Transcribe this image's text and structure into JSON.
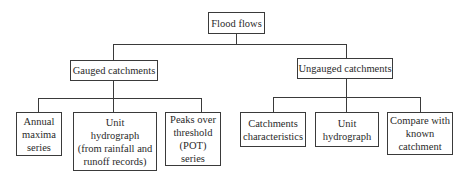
{
  "diagram": {
    "type": "tree",
    "root": {
      "label": "Flood flows"
    },
    "branches": [
      {
        "label": "Gauged catchments",
        "children": [
          {
            "label": "Annual\nmaxima\nseries"
          },
          {
            "label": "Unit\nhydrograph\n(from rainfall and\nrunoff records)"
          },
          {
            "label": "Peaks over\nthreshold\n(POT)\nseries"
          }
        ]
      },
      {
        "label": "Ungauged catchments",
        "children": [
          {
            "label": "Catchments\ncharacteristics"
          },
          {
            "label": "Unit\nhydrograph"
          },
          {
            "label": "Compare with\nknown\ncatchment"
          }
        ]
      }
    ],
    "colors": {
      "line": "#3a3a3a",
      "text": "#2a2a2a",
      "background": "#ffffff"
    }
  }
}
